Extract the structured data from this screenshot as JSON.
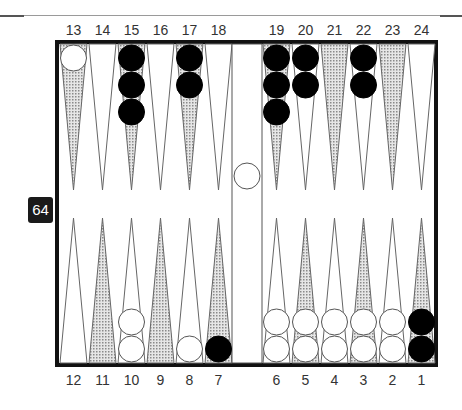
{
  "game": "backgammon",
  "labels": {
    "top": [
      "13",
      "14",
      "15",
      "16",
      "17",
      "18",
      "19",
      "20",
      "21",
      "22",
      "23",
      "24"
    ],
    "bottom": [
      "12",
      "11",
      "10",
      "9",
      "8",
      "7",
      "6",
      "5",
      "4",
      "3",
      "2",
      "1"
    ]
  },
  "cube": {
    "value": "64"
  },
  "colors": {
    "shaded_point": "#b8b8b8",
    "white_checker": "#ffffff",
    "black_checker": "#000000",
    "frame": "#111111"
  },
  "position": {
    "white": {
      "13": 1,
      "10": 2,
      "8": 1,
      "6": 2,
      "5": 2,
      "4": 2,
      "3": 2,
      "2": 2,
      "bar": 1
    },
    "black": {
      "15": 3,
      "17": 2,
      "19": 3,
      "20": 2,
      "22": 2,
      "7": 1,
      "1": 2
    }
  },
  "shaded_points": [
    13,
    15,
    17,
    19,
    21,
    23,
    11,
    9,
    7,
    5,
    3,
    1
  ]
}
